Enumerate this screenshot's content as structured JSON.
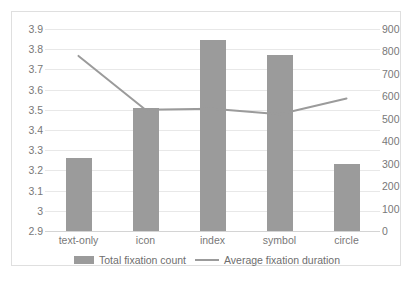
{
  "chart_data": {
    "type": "bar",
    "title": "",
    "subtitle": "",
    "xlabel": "",
    "ylabel": "",
    "categories": [
      "text-only",
      "icon",
      "index",
      "symbol",
      "circle"
    ],
    "grid": true,
    "legend_position": "bottom",
    "series": [
      {
        "name": "Total fixation count",
        "type": "bar",
        "axis": "left",
        "color": "#9b9b9b",
        "values": [
          3.26,
          3.51,
          3.845,
          3.77,
          3.23
        ]
      },
      {
        "name": "Average fixation duration",
        "type": "line",
        "axis": "right",
        "color": "#9b9b9b",
        "values": [
          780,
          540,
          545,
          520,
          590
        ]
      }
    ],
    "left_axis": {
      "label": "",
      "min": 2.9,
      "max": 3.9,
      "step": 0.1,
      "ticks": [
        "3.9",
        "3.8",
        "3.7",
        "3.6",
        "3.5",
        "3.4",
        "3.3",
        "3.2",
        "3.1",
        "3",
        "2.9"
      ]
    },
    "right_axis": {
      "label": "",
      "min": 0,
      "max": 900,
      "step": 100,
      "ticks": [
        "900",
        "800",
        "700",
        "600",
        "500",
        "400",
        "300",
        "200",
        "100",
        "0"
      ]
    }
  },
  "legend": {
    "entries": [
      {
        "label": "Total fixation count",
        "marker": "bar-swatch"
      },
      {
        "label": "Average fixation duration",
        "marker": "line-swatch"
      }
    ]
  },
  "caption": {
    "text": ""
  }
}
